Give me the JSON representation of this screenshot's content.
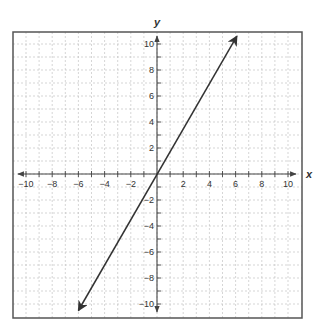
{
  "chart_data": {
    "type": "line",
    "title": "",
    "xlabel": "x",
    "ylabel": "y",
    "xlim": [
      -10,
      10
    ],
    "ylim": [
      -10,
      10
    ],
    "grid": true,
    "grid_minor_step": 1,
    "x_ticks": [
      -10,
      -8,
      -6,
      -4,
      -2,
      2,
      4,
      6,
      8,
      10
    ],
    "y_ticks": [
      -10,
      -8,
      -6,
      -4,
      -2,
      2,
      4,
      6,
      8,
      10
    ],
    "x_tick_labels": [
      "−10",
      "−8",
      "−6",
      "−4",
      "−2",
      "2",
      "4",
      "6",
      "8",
      "10"
    ],
    "y_tick_labels": [
      "−10",
      "−8",
      "−6",
      "−4",
      "−2",
      "2",
      "4",
      "6",
      "8",
      "10"
    ],
    "series": [
      {
        "name": "line",
        "description": "Straight line through the origin with arrows at both ends",
        "slope": 1.75,
        "intercept": 0,
        "x": [
          -6,
          6.1
        ],
        "y": [
          -10.5,
          10.6
        ],
        "arrows": "both"
      }
    ],
    "colors": {
      "line": "#333333",
      "axis": "#444444",
      "grid": "#bbbbbb",
      "frame": "#555555"
    }
  }
}
